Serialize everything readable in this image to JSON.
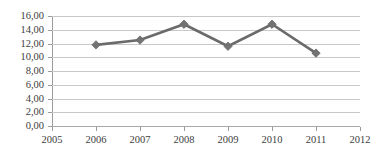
{
  "chart_data": {
    "type": "line",
    "title": "",
    "subtitle": "",
    "xlabel": "",
    "ylabel": "",
    "x": [
      2005,
      2006,
      2007,
      2008,
      2009,
      2010,
      2011,
      2012
    ],
    "categories": [
      "2005",
      "2006",
      "2007",
      "2008",
      "2009",
      "2010",
      "2011",
      "2012"
    ],
    "series": [
      {
        "name": "",
        "x": [
          2006,
          2007,
          2008,
          2009,
          2010,
          2011
        ],
        "values": [
          11.8,
          12.5,
          14.8,
          11.6,
          14.8,
          10.6
        ]
      }
    ],
    "ylim": [
      0,
      16
    ],
    "ytick_values": [
      0,
      2,
      4,
      6,
      8,
      10,
      12,
      14,
      16
    ],
    "ytick_labels": [
      "0,00",
      "2,00",
      "4,00",
      "6,00",
      "8,00",
      "10,00",
      "12,00",
      "14,00",
      "16,00"
    ],
    "xtick_labels": [
      "2005",
      "2006",
      "2007",
      "2008",
      "2009",
      "2010",
      "2011",
      "2012"
    ],
    "grid": true,
    "grid_axis": "y",
    "legend": false,
    "legend_position": "none",
    "marker": "diamond",
    "colors": {
      "line": "#6b6b6b",
      "marker": "#737373",
      "gridline": "#c9c9c9",
      "axis": "#9a9a9a",
      "text": "#3d3d3d",
      "background": "#ffffff"
    },
    "annotations": []
  }
}
